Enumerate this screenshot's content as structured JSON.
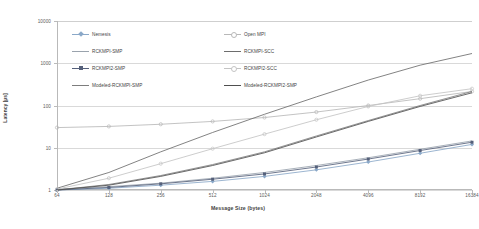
{
  "chart_data": {
    "type": "line",
    "title": "",
    "xlabel": "Message Size (bytes)",
    "ylabel": "Latency [µs]",
    "xscale": "log",
    "yscale": "log",
    "xlim": [
      64,
      16384
    ],
    "ylim": [
      1,
      10000
    ],
    "grid": true,
    "legend_position": "inside-top-left",
    "categories": [
      64,
      128,
      256,
      512,
      1024,
      2048,
      4096,
      8192,
      16384
    ],
    "xticklabels": [
      "64",
      "128",
      "256",
      "512",
      "1024",
      "2048",
      "4096",
      "8192",
      "16384"
    ],
    "yticklabels": [
      "10000",
      "1000",
      "100",
      "10",
      "1"
    ],
    "yticks": [
      10000,
      1000,
      100,
      10,
      1
    ],
    "series": [
      {
        "name": "Nemesis",
        "color": "#8aa8c8",
        "marker": "diamond",
        "values": [
          1.0,
          1.1,
          1.3,
          1.6,
          2.1,
          3.0,
          4.6,
          7.4,
          12.0
        ]
      },
      {
        "name": "Open MPI",
        "color": "#b8b8b8",
        "marker": "circle",
        "values": [
          30,
          32,
          36,
          42,
          52,
          70,
          100,
          145,
          215
        ]
      },
      {
        "name": "RCKMPI-SMP",
        "color": "#9aa3ad",
        "marker": "none",
        "values": [
          1.05,
          1.2,
          1.45,
          1.9,
          2.6,
          3.8,
          5.8,
          9.2,
          14.5
        ]
      },
      {
        "name": "RCKMPI-SCC",
        "color": "#6d6d6d",
        "marker": "none",
        "values": [
          1.1,
          2.6,
          8.0,
          23,
          62,
          160,
          400,
          900,
          1700
        ]
      },
      {
        "name": "RCKMPI2-SMP",
        "color": "#55607a",
        "marker": "square",
        "values": [
          1.0,
          1.15,
          1.4,
          1.8,
          2.4,
          3.5,
          5.4,
          8.6,
          13.5
        ]
      },
      {
        "name": "RCKMPI2-SCC",
        "color": "#c4c4c4",
        "marker": "circle",
        "values": [
          1.05,
          1.9,
          4.2,
          9.5,
          21,
          46,
          95,
          170,
          250
        ]
      },
      {
        "name": "Modeled-RCKMPI-SMP",
        "color": "#7d7d7d",
        "marker": "none",
        "values": [
          1.0,
          1.35,
          2.2,
          4.0,
          8.0,
          19,
          44,
          100,
          215
        ]
      },
      {
        "name": "Modeled-RCKMPI2-SMP",
        "color": "#4f4f4f",
        "marker": "none",
        "values": [
          1.0,
          1.3,
          2.1,
          3.8,
          7.6,
          18,
          42,
          95,
          200
        ]
      }
    ]
  },
  "legend": {
    "entries": [
      "Nemesis",
      "Open MPI",
      "RCKMPI-SMP",
      "RCKMPI-SCC",
      "RCKMPI2-SMP",
      "RCKMPI2-SCC",
      "Modeled-RCKMPI-SMP",
      "Modeled-RCKMPI2-SMP"
    ]
  }
}
